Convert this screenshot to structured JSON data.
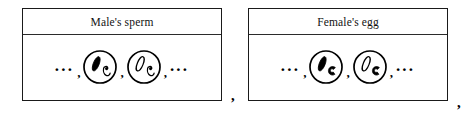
{
  "figure": {
    "type": "biology-diagram",
    "panels": [
      {
        "id": "sperm",
        "title": "Male's sperm",
        "leading_ellipsis": "...",
        "separator": ",",
        "trailing_ellipsis": "...",
        "cells": [
          {
            "name": "sperm-cell-1",
            "long_chromosome": {
              "style": "filled",
              "color": "#000000"
            },
            "hook_chromosome": {
              "style": "outline",
              "color": "#000000"
            }
          },
          {
            "name": "sperm-cell-2",
            "long_chromosome": {
              "style": "outline",
              "color": "#000000"
            },
            "hook_chromosome": {
              "style": "outline",
              "color": "#000000"
            }
          }
        ]
      },
      {
        "id": "egg",
        "title": "Female's egg",
        "leading_ellipsis": "...",
        "separator": ",",
        "trailing_ellipsis": "...",
        "cells": [
          {
            "name": "egg-cell-1",
            "long_chromosome": {
              "style": "filled",
              "color": "#000000"
            },
            "hook_chromosome": {
              "style": "filled",
              "color": "#000000"
            }
          },
          {
            "name": "egg-cell-2",
            "long_chromosome": {
              "style": "outline",
              "color": "#000000"
            },
            "hook_chromosome": {
              "style": "filled",
              "color": "#000000"
            }
          }
        ]
      }
    ],
    "punctuation": {
      "between_panels": ",",
      "after_last_panel": ","
    },
    "colors": {
      "border": "#1a1a1a",
      "background": "#ffffff",
      "ink": "#000000"
    }
  }
}
